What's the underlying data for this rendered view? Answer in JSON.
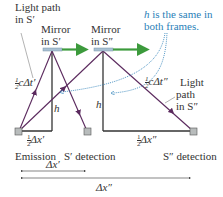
{
  "diagram": {
    "labels": {
      "light_path_s1_line1": "Light path",
      "light_path_s1_line2": "in S′",
      "mirror_s1_line1": "Mirror",
      "mirror_s1_line2": "in S′",
      "mirror_s2_line1": "Mirror",
      "mirror_s2_line2": "in S″",
      "note_line1_h": "h",
      "note_line1_rest": " is the same in",
      "note_line2": "both frames.",
      "half_c_dt1": "cΔt′",
      "half_c_dt2": "cΔt″",
      "light_path_s2_line1": "Light",
      "light_path_s2_line2": "path",
      "light_path_s2_line3": "in S″",
      "h1": "h",
      "h2": "h",
      "half_dx1": "Δx′",
      "half_dx2": "Δx″",
      "frac_num": "1",
      "frac_den": "2",
      "emission": "Emission",
      "s1_detection": "S′ detection",
      "s2_detection": "S″ detection",
      "dx1": "Δx′",
      "dx2": "Δx″"
    },
    "colors": {
      "light_path": "#5b2a5e",
      "frame_line": "#333333",
      "mirror": "#a9c1d3",
      "velocity_arrow": "#3c9a3c",
      "note_blue": "#2b7fb8",
      "detector_fill": "#b8bcbc"
    }
  }
}
